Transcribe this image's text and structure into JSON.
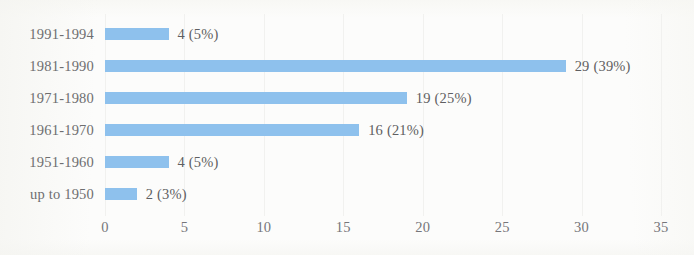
{
  "chart_data": {
    "type": "bar",
    "orientation": "horizontal",
    "title": "",
    "subtitle": "",
    "xlabel": "",
    "ylabel": "",
    "xlim": [
      0,
      35
    ],
    "xticks": [
      "0",
      "5",
      "10",
      "15",
      "20",
      "25",
      "30",
      "35"
    ],
    "xtick_step": 5,
    "grid": true,
    "grid_axis": "x",
    "legend": false,
    "legend_position": "none",
    "categories": [
      "1991-1994",
      "1981-1990",
      "1971-1980",
      "1961-1970",
      "1951-1960",
      "up to 1950"
    ],
    "values": [
      4,
      29,
      19,
      16,
      4,
      2
    ],
    "percents": [
      5,
      39,
      25,
      21,
      5,
      3
    ],
    "data_labels": [
      "4 (5%)",
      "29 (39%)",
      "19 (25%)",
      "16 (21%)",
      "4 (5%)",
      "2 (3%)"
    ],
    "series": [
      {
        "name": "",
        "values": [
          4,
          29,
          19,
          16,
          4,
          2
        ]
      }
    ],
    "bar_color": "#8ec1ed",
    "text_color": "#6e6e70",
    "background_color": "#fcfcfb",
    "gridline_color": "#f1f1ef"
  },
  "axis": {
    "ticks": [
      {
        "label": "0",
        "value": 0
      },
      {
        "label": "5",
        "value": 5
      },
      {
        "label": "10",
        "value": 10
      },
      {
        "label": "15",
        "value": 15
      },
      {
        "label": "20",
        "value": 20
      },
      {
        "label": "25",
        "value": 25
      },
      {
        "label": "30",
        "value": 30
      },
      {
        "label": "35",
        "value": 35
      }
    ]
  },
  "rows": [
    {
      "label": "1991-1994",
      "value": 4,
      "data_label": "4 (5%)"
    },
    {
      "label": "1981-1990",
      "value": 29,
      "data_label": "29 (39%)"
    },
    {
      "label": "1971-1980",
      "value": 19,
      "data_label": "19 (25%)"
    },
    {
      "label": "1961-1970",
      "value": 16,
      "data_label": "16 (21%)"
    },
    {
      "label": "1951-1960",
      "value": 4,
      "data_label": "4 (5%)"
    },
    {
      "label": "up to 1950",
      "value": 2,
      "data_label": "2 (3%)"
    }
  ]
}
